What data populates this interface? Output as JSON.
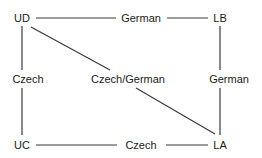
{
  "diagram": {
    "width": 262,
    "height": 158,
    "background_color": "#ffffff",
    "line_color": "#3a3a3a",
    "text_color": "#1a1a1a",
    "nodes": [
      {
        "id": "UD",
        "label": "UD",
        "x": 22,
        "y": 18,
        "anchor": "center"
      },
      {
        "id": "LB",
        "label": "LB",
        "x": 220,
        "y": 18,
        "anchor": "center"
      },
      {
        "id": "UC",
        "label": "UC",
        "x": 22,
        "y": 145,
        "anchor": "center"
      },
      {
        "id": "LA",
        "label": "LA",
        "x": 220,
        "y": 145,
        "anchor": "center"
      }
    ],
    "edge_labels": [
      {
        "id": "top-edge-label",
        "label": "German",
        "x": 141,
        "y": 18,
        "anchor": "center"
      },
      {
        "id": "left-edge-label",
        "label": "Czech",
        "x": 28,
        "y": 79,
        "anchor": "center"
      },
      {
        "id": "right-edge-label",
        "label": "German",
        "x": 229,
        "y": 79,
        "anchor": "center"
      },
      {
        "id": "diagonal-edge-label",
        "label": "Czech/German",
        "x": 128,
        "y": 79,
        "anchor": "center"
      },
      {
        "id": "bottom-edge-label",
        "label": "Czech",
        "x": 141,
        "y": 145,
        "anchor": "center"
      }
    ],
    "edges": [
      {
        "id": "ud-to-german-top",
        "from": "UD",
        "to": "top-edge-label",
        "x1": 36,
        "y1": 18,
        "x2": 116,
        "y2": 18
      },
      {
        "id": "german-top-to-lb",
        "from": "top-edge-label",
        "to": "LB",
        "x1": 167,
        "y1": 18,
        "x2": 208,
        "y2": 18
      },
      {
        "id": "ud-to-czech-left",
        "from": "UD",
        "to": "left-edge-label",
        "x1": 22,
        "y1": 26,
        "x2": 22,
        "y2": 70
      },
      {
        "id": "czech-left-to-uc",
        "from": "left-edge-label",
        "to": "UC",
        "x1": 22,
        "y1": 88,
        "x2": 22,
        "y2": 135
      },
      {
        "id": "lb-to-german-right",
        "from": "LB",
        "to": "right-edge-label",
        "x1": 220,
        "y1": 26,
        "x2": 220,
        "y2": 70
      },
      {
        "id": "german-right-to-la",
        "from": "right-edge-label",
        "to": "LA",
        "x1": 220,
        "y1": 88,
        "x2": 220,
        "y2": 135
      },
      {
        "id": "uc-to-czech-bottom",
        "from": "UC",
        "to": "bottom-edge-label",
        "x1": 36,
        "y1": 145,
        "x2": 117,
        "y2": 145
      },
      {
        "id": "czech-bottom-to-la",
        "from": "bottom-edge-label",
        "to": "LA",
        "x1": 166,
        "y1": 145,
        "x2": 208,
        "y2": 145
      },
      {
        "id": "ud-to-czech-german",
        "from": "UD",
        "to": "diagonal-edge-label",
        "x1": 31,
        "y1": 27,
        "x2": 110,
        "y2": 70
      },
      {
        "id": "czech-german-to-la",
        "from": "diagonal-edge-label",
        "to": "LA",
        "x1": 136,
        "y1": 88,
        "x2": 215,
        "y2": 134
      }
    ]
  }
}
